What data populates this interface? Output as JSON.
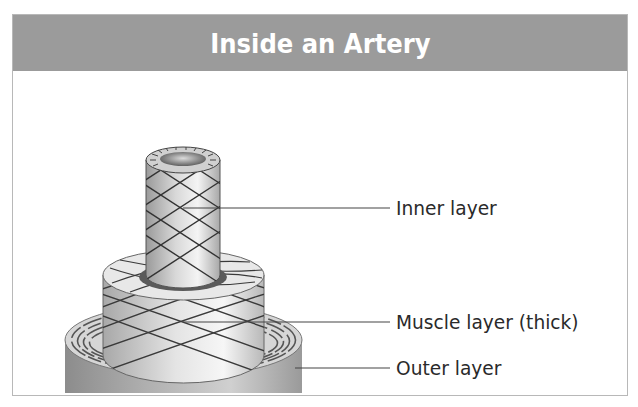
{
  "header": {
    "title": "Inside an Artery"
  },
  "diagram": {
    "labels": [
      {
        "id": "inner",
        "text": "Inner layer"
      },
      {
        "id": "muscle",
        "text": "Muscle layer (thick)"
      },
      {
        "id": "outer",
        "text": "Outer layer"
      }
    ]
  },
  "colors": {
    "header_bg": "#9b9b9b",
    "header_text": "#ffffff",
    "frame_border": "#b8b8b8",
    "label_text": "#2a2a2a",
    "leader_line": "#444444"
  }
}
